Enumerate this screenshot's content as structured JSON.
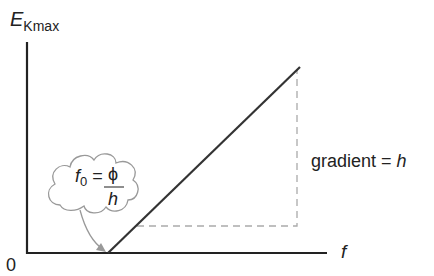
{
  "diagram": {
    "type": "graph",
    "y_axis_label": {
      "main": "E",
      "subscript": "Kmax"
    },
    "x_axis_label": "f",
    "origin_label": "0",
    "gradient_label": {
      "text": "gradient = ",
      "symbol": "h"
    },
    "threshold_callout": {
      "lhs": "f",
      "lhs_sub": "0",
      "equals": "=",
      "numerator": "ϕ",
      "denominator": "h"
    },
    "colors": {
      "axis": "#222222",
      "line": "#333333",
      "dashed": "#aaaaaa",
      "callout": "#999999"
    }
  }
}
